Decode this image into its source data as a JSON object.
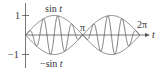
{
  "chart_data": {
    "type": "line",
    "title": "",
    "xlabel": "t",
    "ylabel": "",
    "xlim": [
      0,
      6.6
    ],
    "ylim": [
      -1.25,
      1.25
    ],
    "grid": false,
    "legend": "none (curves labeled inline)",
    "x_ticks": [
      {
        "value": 3.14159,
        "label": "π"
      },
      {
        "value": 6.28318,
        "label": "2π"
      }
    ],
    "y_ticks": [
      {
        "value": 1,
        "label": "1"
      },
      {
        "value": -1,
        "label": "−1"
      }
    ],
    "series": [
      {
        "name": "sin t",
        "expression": "sin(t)",
        "domain": [
          0,
          6.28318
        ],
        "role": "upper envelope"
      },
      {
        "name": "−sin t",
        "expression": "-sin(t)",
        "domain": [
          0,
          6.28318
        ],
        "role": "lower envelope"
      },
      {
        "name": "modulated",
        "expression": "sin(t)·sin(8t)",
        "domain": [
          0,
          6.28318
        ],
        "role": "fast oscillation bounded by ±sin t"
      }
    ],
    "annotations": [
      {
        "text": "sin t",
        "near": "upper envelope peak"
      },
      {
        "text": "−sin t",
        "near": "lower envelope trough"
      },
      {
        "text": "π",
        "near": "x-axis crossing at π"
      },
      {
        "text": "2π",
        "near": "x-axis at 2π"
      },
      {
        "text": "t",
        "near": "x-axis arrow"
      }
    ]
  },
  "labels": {
    "y_pos": "1",
    "y_neg": "−1",
    "sin_prefix": "sin ",
    "neg_sin_prefix": "−sin ",
    "var": "t",
    "pi": "π",
    "two_pi": "2π",
    "axis_t": "t"
  },
  "style": {
    "axis_color": "#555555",
    "curve_color": "#666666",
    "text_color": "#333333"
  }
}
